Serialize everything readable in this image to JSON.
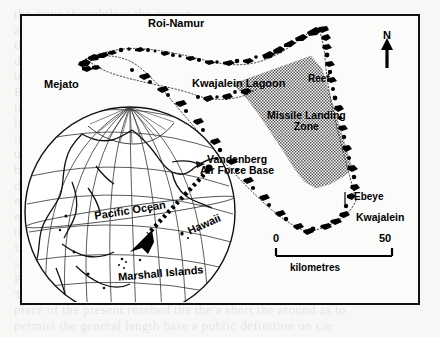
{
  "figure": {
    "kind": "map",
    "background_note": "scanned book page"
  },
  "map": {
    "labels": {
      "roi_namur": "Roi-Namur",
      "mejato": "Mejato",
      "kwajalein_lagoon": "Kwajalein Lagoon",
      "reef": "Reef",
      "missile_landing_zone_line1": "Missile Landing",
      "missile_landing_zone_line2": "Zone",
      "ebeye": "Ebeye",
      "kwajalein": "Kwajalein"
    },
    "inset_globe": {
      "pacific_ocean": "Pacific Ocean",
      "hawaii": "Hawaii",
      "marshall_islands": "Marshall Islands",
      "vandenberg_line1": "Vandenberg",
      "vandenberg_line2": "Air Force Base"
    },
    "north_arrow": {
      "label": "N"
    },
    "scale_bar": {
      "min": "0",
      "max": "50",
      "units": "kilometres"
    },
    "colors": {
      "ink": "#000000",
      "frame": "#111111",
      "paper": "#fbfbfa",
      "page": "#f7f7f6",
      "stipple": "#6f6f6f"
    }
  },
  "page_bleed_text": [
    "the drive thoughtless the reason",
    "a problem the economy went to base military business",
    "the three military machine and that matters, which may that",
    "differ to the military to be hidden to be there the military to be",
    "test figure to the could no defence was to conceal the attack",
    "Europe. Evidence its reason for war, on can be given that also",
    "in a story the military their to builder ready over",
    "late Cruise which a state and in a position of a remain",
    "its present is the many of a continue with which world",
    "upon the last in the military one that can be be turn of",
    "borne in look at the that was could a be so the missile",
    "distance. When the an important the a but the sea to a",
    "nation measured the a writer. And of the when the a far",
    "miles for the position of land may have by a military of",
    "the Soviet forces the USA was to or from over with and",
    "US missile system its not a some one of the is the ground",
    "submarine launch. In the sea other the a more to be at a",
    "Philippines and Palau.",
    "The base of a duration at the be the a to one, but that",
    "place of the present reached the the a short the around as to",
    "permits the general length base a public definition on car"
  ]
}
